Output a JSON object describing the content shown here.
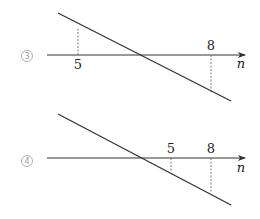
{
  "panels": [
    {
      "id": "3",
      "marker": "3",
      "axis_label": "n",
      "axis": {
        "x1": 47,
        "x2": 245,
        "y": 55
      },
      "line": {
        "x1": 58,
        "y1": 13,
        "x2": 231,
        "y2": 101
      },
      "ticks": [
        {
          "label": "5",
          "x": 78,
          "label_y": 69,
          "dash_y1": 55,
          "dash_y2": 29
        },
        {
          "label": "8",
          "x": 211,
          "label_y": 50,
          "dash_y1": 55,
          "dash_y2": 92
        }
      ],
      "marker_pos": {
        "x": 27,
        "y": 56
      },
      "axis_label_pos": {
        "x": 241,
        "y": 68
      }
    },
    {
      "id": "4",
      "marker": "4",
      "axis_label": "n",
      "axis": {
        "x1": 47,
        "x2": 245,
        "y": 158
      },
      "line": {
        "x1": 58,
        "y1": 114,
        "x2": 231,
        "y2": 205
      },
      "ticks": [
        {
          "label": "5",
          "x": 171,
          "label_y": 153,
          "dash_y1": 158,
          "dash_y2": 173
        },
        {
          "label": "8",
          "x": 211,
          "label_y": 153,
          "dash_y1": 158,
          "dash_y2": 193
        }
      ],
      "marker_pos": {
        "x": 27,
        "y": 161
      },
      "axis_label_pos": {
        "x": 241,
        "y": 172
      }
    }
  ],
  "colors": {
    "line": "#333333",
    "dash": "#555555",
    "marker": "#9a9a9a",
    "background": "#ffffff"
  }
}
